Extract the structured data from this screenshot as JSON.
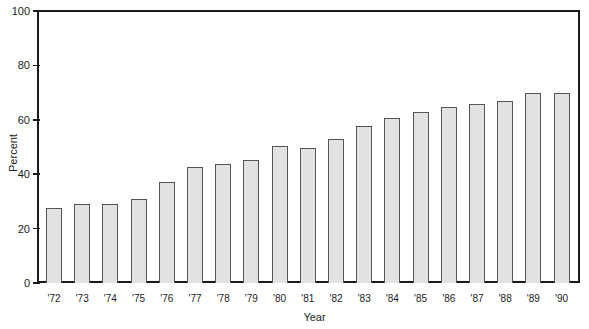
{
  "chart_data": {
    "type": "bar",
    "title": "",
    "xlabel": "Year",
    "ylabel": "Percent",
    "ylim": [
      0,
      100
    ],
    "yticks": [
      0,
      20,
      40,
      60,
      80,
      100
    ],
    "grid": false,
    "legend": null,
    "categories": [
      "'72",
      "'73",
      "'74",
      "'75",
      "'76",
      "'77",
      "'78",
      "'79",
      "'80",
      "'81",
      "'82",
      "'83",
      "'84",
      "'85",
      "'86",
      "'87",
      "'88",
      "'89",
      "'90"
    ],
    "values": [
      27.4,
      28.9,
      28.9,
      30.7,
      37.0,
      42.7,
      43.8,
      45.4,
      50.4,
      49.5,
      53.0,
      57.7,
      60.7,
      62.8,
      64.7,
      65.9,
      66.9,
      69.9,
      70.0
    ],
    "colors": {
      "bar_fill": "#e2e2e2",
      "bar_edge": "#555555",
      "axis": "#1a1a1a"
    }
  }
}
